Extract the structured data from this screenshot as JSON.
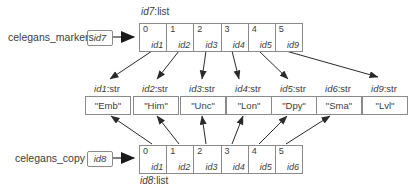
{
  "colors": {
    "background": "#ffffff",
    "border": "#8a8a8a",
    "text": "#3c3c3c",
    "arrow": "#2a2a2a"
  },
  "variables": [
    {
      "name": "celegans_markers",
      "ref": "id7"
    },
    {
      "name": "celegans_copy",
      "ref": "id8"
    }
  ],
  "top_list": {
    "label": {
      "id": "id7",
      "suffix": ":list"
    },
    "cells": [
      {
        "index": "0",
        "ref": "id1"
      },
      {
        "index": "1",
        "ref": "id2"
      },
      {
        "index": "2",
        "ref": "id3"
      },
      {
        "index": "3",
        "ref": "id4"
      },
      {
        "index": "4",
        "ref": "id5"
      },
      {
        "index": "5",
        "ref": "id9"
      }
    ]
  },
  "bottom_list": {
    "label": {
      "id": "id8",
      "suffix": ":list"
    },
    "cells": [
      {
        "index": "0",
        "ref": "id1"
      },
      {
        "index": "1",
        "ref": "id2"
      },
      {
        "index": "2",
        "ref": "id3"
      },
      {
        "index": "3",
        "ref": "id4"
      },
      {
        "index": "4",
        "ref": "id5"
      },
      {
        "index": "5",
        "ref": "id6"
      }
    ]
  },
  "strings": [
    {
      "id": "id1",
      "suffix": ":str",
      "value": "\"Emb\""
    },
    {
      "id": "id2",
      "suffix": ":str",
      "value": "\"Him\""
    },
    {
      "id": "id3",
      "suffix": ":str",
      "value": "\"Unc\""
    },
    {
      "id": "id4",
      "suffix": ":str",
      "value": "\"Lon\""
    },
    {
      "id": "id5",
      "suffix": ":str",
      "value": "\"Dpy\""
    },
    {
      "id": "id6",
      "suffix": ":str",
      "value": "\"Sma\""
    },
    {
      "id": "id9",
      "suffix": ":str",
      "value": "\"Lvl\""
    }
  ]
}
